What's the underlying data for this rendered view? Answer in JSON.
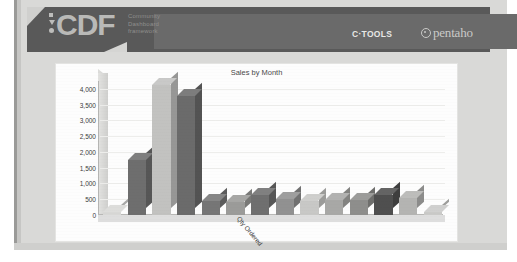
{
  "header": {
    "logo_text": "CDF",
    "logo_subtitle": "Community\nDashboard\nframework",
    "logo_subtitle_lines": [
      "Community",
      "Dashboard",
      "framework"
    ],
    "ctools_label": "C·TOOLS",
    "pentaho_label": "pentaho",
    "bar_color": "#595959",
    "logo_color": "#b9b9b7"
  },
  "chart_data": {
    "type": "bar",
    "title": "Sales by Month",
    "xlabel": "Qty Ordered",
    "ylabel": "",
    "grid": true,
    "legend": null,
    "ylim": [
      0,
      4250
    ],
    "yticks": [
      0,
      500,
      1000,
      1500,
      2000,
      2500,
      3000,
      3500,
      4000
    ],
    "ytick_labels": [
      "0",
      "500",
      "1,000",
      "1,500",
      "2,000",
      "2,500",
      "3,000",
      "3,500",
      "4,000"
    ],
    "categories": [
      "1",
      "2",
      "3",
      "4",
      "5",
      "6",
      "7",
      "8",
      "9",
      "10",
      "11",
      "12",
      "13",
      "14"
    ],
    "values": [
      110,
      1740,
      4120,
      3760,
      430,
      400,
      620,
      500,
      430,
      480,
      470,
      620,
      540,
      90
    ],
    "colors": [
      "#d8d8d6",
      "#6e6e6e",
      "#c2c2c0",
      "#6b6b6b",
      "#767676",
      "#9b9b99",
      "#6f6f6f",
      "#919191",
      "#c8c8c6",
      "#a8a8a6",
      "#8e8e8c",
      "#4f4f4f",
      "#b4b4b2",
      "#cacac8"
    ]
  },
  "panel": {
    "background": "#fdfdfd"
  }
}
